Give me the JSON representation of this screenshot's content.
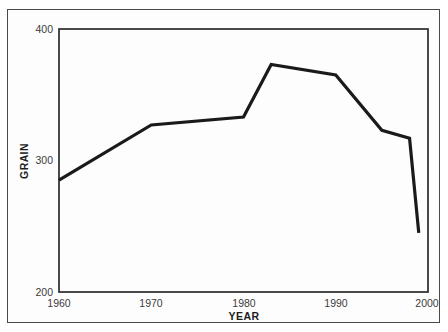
{
  "chart_data": {
    "type": "line",
    "title": "",
    "xlabel": "YEAR",
    "ylabel": "GRAIN",
    "xlim": [
      1960,
      2000
    ],
    "ylim": [
      200,
      400
    ],
    "xticks": [
      1960,
      1970,
      1980,
      1990,
      2000
    ],
    "xtick_labels": [
      "1960",
      "1970",
      "1980",
      "1990",
      "2000"
    ],
    "yticks": [
      200,
      300,
      400
    ],
    "ytick_labels": [
      "200",
      "300",
      "400"
    ],
    "grid": false,
    "legend": null,
    "series": [
      {
        "name": "GRAIN",
        "color": "#1a1a1a",
        "linewidth": 3.2,
        "x": [
          1960,
          1970,
          1980,
          1983,
          1990,
          1995,
          1998,
          1999
        ],
        "values": [
          285,
          327,
          333,
          373,
          365,
          323,
          317,
          245
        ],
        "points": [
          {
            "year": 1960,
            "value": 285
          },
          {
            "year": 1970,
            "value": 327
          },
          {
            "year": 1980,
            "value": 333
          },
          {
            "year": 1983,
            "value": 373
          },
          {
            "year": 1990,
            "value": 365
          },
          {
            "year": 1995,
            "value": 323
          },
          {
            "year": 1998,
            "value": 317
          },
          {
            "year": 1999,
            "value": 245
          }
        ]
      }
    ]
  },
  "axes": {
    "y_axis_title": "GRAIN",
    "x_axis_title": "YEAR",
    "y_tick_0": "200",
    "y_tick_1": "300",
    "y_tick_2": "400",
    "x_tick_0": "1960",
    "x_tick_1": "1970",
    "x_tick_2": "1980",
    "x_tick_3": "1990",
    "x_tick_4": "2000"
  },
  "colors": {
    "line": "#1a1a1a",
    "frame": "#2b2b2b",
    "outer_border": "#4a4a4a",
    "background": "#ffffff",
    "tick_text": "#3b3b3b"
  }
}
